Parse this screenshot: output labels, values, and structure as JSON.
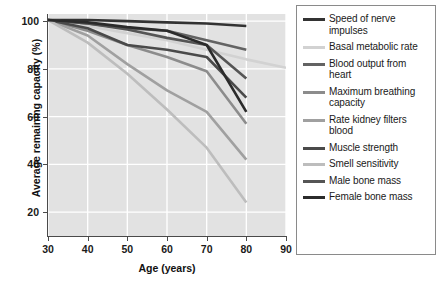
{
  "chart_data": {
    "type": "line",
    "title": "",
    "xlabel": "Age (years)",
    "ylabel": "Average remaining capacity (%)",
    "xlim": [
      30,
      90
    ],
    "ylim": [
      10,
      103
    ],
    "xticks": [
      30,
      40,
      50,
      60,
      70,
      80,
      90
    ],
    "yticks": [
      20,
      40,
      60,
      80,
      100
    ],
    "grid": true,
    "legend_position": "right",
    "x": [
      30,
      40,
      50,
      60,
      70,
      80
    ],
    "series": [
      {
        "name": "Speed of nerve impulses",
        "color": "#333333",
        "values": [
          100.5,
          100.5,
          100.0,
          99.5,
          99.0,
          98.0
        ],
        "x": [
          30,
          40,
          50,
          60,
          70,
          80
        ]
      },
      {
        "name": "Basal metabolic rate",
        "color": "#d2d2d2",
        "values": [
          100.5,
          98.0,
          95.0,
          92.0,
          88.0,
          84.0,
          80.5
        ],
        "x": [
          30,
          40,
          50,
          60,
          70,
          80,
          90
        ]
      },
      {
        "name": "Blood output from heart",
        "color": "#636363",
        "values": [
          100.5,
          99.0,
          97.0,
          96.0,
          92.0,
          88.0
        ],
        "x": [
          30,
          40,
          50,
          60,
          70,
          80
        ]
      },
      {
        "name": "Maximum breathing capacity",
        "color": "#8c8c8c",
        "values": [
          100.5,
          96.0,
          90.0,
          85.0,
          79.0,
          57.0
        ],
        "x": [
          30,
          40,
          50,
          60,
          70,
          80
        ]
      },
      {
        "name": "Rate kidney filters blood",
        "color": "#a0a0a0",
        "values": [
          100.5,
          94.0,
          82.0,
          71.0,
          62.0,
          42.0
        ],
        "x": [
          30,
          40,
          50,
          60,
          70,
          80
        ]
      },
      {
        "name": "Muscle strength",
        "color": "#4a4a4a",
        "values": [
          100.5,
          97.0,
          90.0,
          88.0,
          85.0,
          68.0
        ],
        "x": [
          30,
          40,
          50,
          60,
          70,
          80
        ]
      },
      {
        "name": "Smell sensitivity",
        "color": "#bdbdbd",
        "values": [
          100.5,
          91.0,
          78.0,
          63.0,
          47.0,
          24.0
        ],
        "x": [
          30,
          40,
          50,
          60,
          70,
          80
        ]
      },
      {
        "name": "Male bone mass",
        "color": "#555555",
        "values": [
          100.5,
          99.0,
          96.5,
          93.0,
          90.0,
          76.0
        ],
        "x": [
          30,
          40,
          50,
          60,
          70,
          80
        ]
      },
      {
        "name": "Female bone mass",
        "color": "#2b2b2b",
        "values": [
          100.5,
          99.5,
          97.5,
          96.0,
          90.0,
          62.0
        ],
        "x": [
          30,
          40,
          50,
          60,
          70,
          80
        ]
      }
    ]
  },
  "axes": {
    "x_title": "Age (years)",
    "y_title": "Average remaining capacity (%)",
    "x_tick_labels": [
      "30",
      "40",
      "50",
      "60",
      "70",
      "80",
      "90"
    ],
    "y_tick_labels": [
      "20",
      "40",
      "60",
      "80",
      "100"
    ]
  },
  "legend": {
    "items": [
      {
        "label": "Speed of nerve impulses",
        "color": "#333333"
      },
      {
        "label": "Basal metabolic rate",
        "color": "#d2d2d2"
      },
      {
        "label": "Blood output from heart",
        "color": "#636363"
      },
      {
        "label": "Maximum breathing capacity",
        "color": "#8c8c8c"
      },
      {
        "label": "Rate kidney filters blood",
        "color": "#a0a0a0"
      },
      {
        "label": "Muscle strength",
        "color": "#4a4a4a"
      },
      {
        "label": "Smell sensitivity",
        "color": "#bdbdbd"
      },
      {
        "label": "Male bone mass",
        "color": "#555555"
      },
      {
        "label": "Female bone mass",
        "color": "#2b2b2b"
      }
    ]
  },
  "style": {
    "plot_background": "#e2e2e2",
    "grid_color": "#ffffff",
    "axis_color": "#4a4a4a",
    "legend_border": "#8a8a8a",
    "text_color": "#1a1a1a"
  }
}
